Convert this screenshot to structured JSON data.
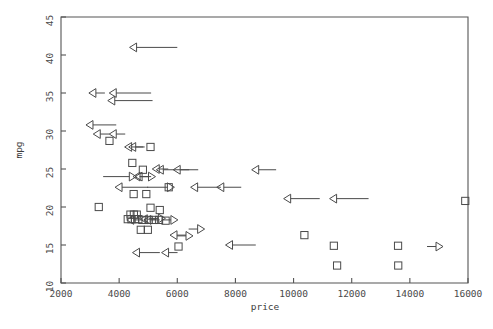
{
  "chart_data": {
    "type": "scatter",
    "title": "",
    "xlabel": "price",
    "ylabel": "mpg",
    "xlim": [
      2000,
      16000
    ],
    "ylim": [
      10,
      45
    ],
    "grid": false,
    "legend": "none",
    "xticks": [
      2000,
      4000,
      6000,
      8000,
      10000,
      12000,
      14000,
      16000
    ],
    "xtick_labels": [
      "2000",
      "4000",
      "6000",
      "8000",
      "10000",
      "12000",
      "14000",
      "16000"
    ],
    "yticks": [
      10,
      15,
      20,
      25,
      30,
      35,
      40,
      45
    ],
    "ytick_labels": [
      "10",
      "15",
      "20",
      "25",
      "30",
      "35",
      "40",
      "45"
    ],
    "marker_types": [
      "square",
      "left-arrow",
      "right-arrow"
    ],
    "series": [
      {
        "name": "square",
        "marker": "square",
        "points": [
          {
            "x": 3667,
            "y": 28.7
          },
          {
            "x": 5079,
            "y": 27.9
          },
          {
            "x": 4453,
            "y": 25.8
          },
          {
            "x": 4816,
            "y": 24.9
          },
          {
            "x": 5705,
            "y": 22.6
          },
          {
            "x": 4499,
            "y": 21.7
          },
          {
            "x": 4934,
            "y": 21.7
          },
          {
            "x": 3299,
            "y": 20.0
          },
          {
            "x": 4389,
            "y": 19.0
          },
          {
            "x": 4507,
            "y": 19.0
          },
          {
            "x": 4606,
            "y": 19.0
          },
          {
            "x": 5079,
            "y": 19.9
          },
          {
            "x": 5397,
            "y": 19.6
          },
          {
            "x": 4296,
            "y": 18.4
          },
          {
            "x": 4424,
            "y": 18.4
          },
          {
            "x": 4545,
            "y": 18.4
          },
          {
            "x": 4663,
            "y": 18.4
          },
          {
            "x": 4800,
            "y": 18.3
          },
          {
            "x": 5018,
            "y": 18.3
          },
          {
            "x": 5189,
            "y": 18.3
          },
          {
            "x": 5372,
            "y": 18.3
          },
          {
            "x": 5598,
            "y": 18.2
          },
          {
            "x": 4745,
            "y": 17.0
          },
          {
            "x": 4987,
            "y": 17.0
          },
          {
            "x": 6042,
            "y": 14.8
          },
          {
            "x": 10372,
            "y": 16.3
          },
          {
            "x": 11385,
            "y": 14.9
          },
          {
            "x": 11497,
            "y": 12.3
          },
          {
            "x": 13594,
            "y": 14.9
          },
          {
            "x": 13600,
            "y": 12.3
          },
          {
            "x": 15906,
            "y": 20.8
          }
        ]
      },
      {
        "name": "left-arrow",
        "marker": "left-arrow",
        "points": [
          {
            "x": 4600,
            "y": 41.0,
            "tail": 1400
          },
          {
            "x": 3200,
            "y": 35.0,
            "tail": 0
          },
          {
            "x": 3900,
            "y": 35.0,
            "tail": 1200
          },
          {
            "x": 3850,
            "y": 34.0,
            "tail": 1300
          },
          {
            "x": 3100,
            "y": 30.8,
            "tail": 800
          },
          {
            "x": 3350,
            "y": 29.6,
            "tail": 0
          },
          {
            "x": 3900,
            "y": 29.6,
            "tail": 0
          },
          {
            "x": 4430,
            "y": 27.9,
            "tail": 400
          },
          {
            "x": 4570,
            "y": 27.9,
            "tail": 0
          },
          {
            "x": 5520,
            "y": 24.9,
            "tail": 1200
          },
          {
            "x": 6100,
            "y": 24.9,
            "tail": 0
          },
          {
            "x": 8800,
            "y": 24.9,
            "tail": 600
          },
          {
            "x": 4100,
            "y": 22.6,
            "tail": 900
          },
          {
            "x": 4720,
            "y": 24.0,
            "tail": 0
          },
          {
            "x": 4790,
            "y": 24.0,
            "tail": 0
          },
          {
            "x": 6700,
            "y": 22.6,
            "tail": 800
          },
          {
            "x": 7600,
            "y": 22.6,
            "tail": 600
          },
          {
            "x": 9900,
            "y": 21.1,
            "tail": 1000
          },
          {
            "x": 11480,
            "y": 21.1,
            "tail": 1100
          },
          {
            "x": 4970,
            "y": 18.4,
            "tail": 0
          },
          {
            "x": 4500,
            "y": 18.3,
            "tail": 0
          },
          {
            "x": 5090,
            "y": 18.3,
            "tail": 0
          },
          {
            "x": 5990,
            "y": 16.3,
            "tail": 0
          },
          {
            "x": 7900,
            "y": 15.0,
            "tail": 800
          },
          {
            "x": 4700,
            "y": 14.0,
            "tail": 700
          },
          {
            "x": 5700,
            "y": 14.0,
            "tail": 0
          },
          {
            "x": 5380,
            "y": 25.0,
            "tail": 0
          }
        ]
      },
      {
        "name": "right-arrow",
        "marker": "right-arrow",
        "points": [
          {
            "x": 4350,
            "y": 24.0,
            "tail": 900
          },
          {
            "x": 5010,
            "y": 24.0,
            "tail": 0
          },
          {
            "x": 5660,
            "y": 22.6,
            "tail": 700
          },
          {
            "x": 5350,
            "y": 18.5,
            "tail": 0
          },
          {
            "x": 5780,
            "y": 18.3,
            "tail": 0
          },
          {
            "x": 6700,
            "y": 17.1,
            "tail": 0
          },
          {
            "x": 6300,
            "y": 16.2,
            "tail": 0
          },
          {
            "x": 14900,
            "y": 14.8,
            "tail": 0
          }
        ]
      }
    ]
  },
  "axes": {
    "x_title": "price",
    "y_title": "mpg"
  },
  "colors": {
    "marker": "#4a4a4a",
    "axis": "#555555",
    "background": "#ffffff"
  }
}
